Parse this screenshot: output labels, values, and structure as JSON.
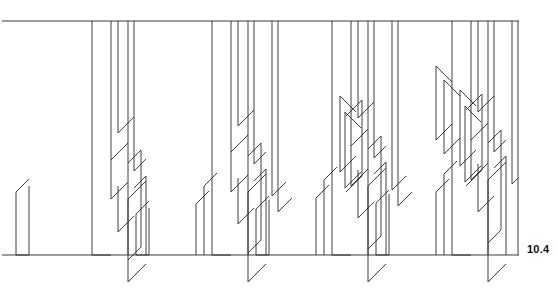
{
  "figure": {
    "label": "10.4",
    "label_x": 527,
    "label_y": 243,
    "background_color": "#ffffff",
    "line_color": "#2b2b2b",
    "rule_color": "#3a3a3a"
  },
  "chart_data": {
    "type": "line",
    "title": "",
    "subtitle": "",
    "xlabel": "",
    "ylabel": "",
    "annotations": [
      "10.4"
    ],
    "grid": false,
    "legend": null,
    "xlim": [
      0,
      558
    ],
    "ylim": [
      295,
      0
    ],
    "axis_rules": [
      {
        "name": "top-rule",
        "x1": 2,
        "y1": 21,
        "x2": 519,
        "y2": 21
      },
      {
        "name": "baseline-rule",
        "x1": 2,
        "y1": 255,
        "x2": 519,
        "y2": 255
      }
    ],
    "panels": [
      {
        "name": "panel-1",
        "origin_x": 0,
        "density": 1
      },
      {
        "name": "panel-2",
        "origin_x": 120,
        "density": 2
      },
      {
        "name": "panel-3",
        "origin_x": 240,
        "density": 3
      },
      {
        "name": "panel-4",
        "origin_x": 360,
        "density": 4
      }
    ],
    "series": [
      {
        "name": "stems",
        "comment": "vertical segments: x, y_top, y_bottom",
        "values": [
          [
            92,
            21,
            255
          ],
          [
            111,
            21,
            160
          ],
          [
            118,
            21,
            133
          ],
          [
            128,
            21,
            255
          ],
          [
            134,
            21,
            171
          ],
          [
            16,
            192,
            255
          ],
          [
            29,
            186,
            255
          ],
          [
            111,
            160,
            199
          ],
          [
            118,
            186,
            232
          ],
          [
            128,
            199,
            282
          ],
          [
            141,
            150,
            247
          ],
          [
            146,
            176,
            255
          ],
          [
            212,
            21,
            255
          ],
          [
            231,
            21,
            152
          ],
          [
            238,
            21,
            126
          ],
          [
            248,
            21,
            255
          ],
          [
            254,
            21,
            164
          ],
          [
            136,
            214,
            255
          ],
          [
            149,
            208,
            255
          ],
          [
            231,
            152,
            192
          ],
          [
            238,
            178,
            224
          ],
          [
            248,
            192,
            282
          ],
          [
            261,
            143,
            240
          ],
          [
            266,
            169,
            255
          ],
          [
            272,
            21,
            196
          ],
          [
            278,
            21,
            212
          ],
          [
            196,
            204,
            255
          ],
          [
            204,
            186,
            255
          ],
          [
            332,
            21,
            255
          ],
          [
            351,
            21,
            146
          ],
          [
            358,
            21,
            118
          ],
          [
            368,
            21,
            255
          ],
          [
            374,
            21,
            158
          ],
          [
            256,
            209,
            255
          ],
          [
            269,
            200,
            255
          ],
          [
            351,
            146,
            186
          ],
          [
            358,
            170,
            218
          ],
          [
            368,
            186,
            282
          ],
          [
            381,
            136,
            236
          ],
          [
            386,
            162,
            255
          ],
          [
            392,
            21,
            190
          ],
          [
            398,
            21,
            206
          ],
          [
            316,
            198,
            255
          ],
          [
            324,
            180,
            255
          ],
          [
            340,
            96,
            172
          ],
          [
            345,
            112,
            188
          ],
          [
            362,
            100,
            176
          ],
          [
            452,
            21,
            255
          ],
          [
            471,
            21,
            140
          ],
          [
            478,
            21,
            112
          ],
          [
            488,
            21,
            255
          ],
          [
            494,
            21,
            152
          ],
          [
            376,
            203,
            255
          ],
          [
            389,
            194,
            255
          ],
          [
            471,
            140,
            180
          ],
          [
            478,
            164,
            212
          ],
          [
            488,
            180,
            282
          ],
          [
            501,
            130,
            230
          ],
          [
            506,
            156,
            255
          ],
          [
            512,
            21,
            184
          ],
          [
            518,
            21,
            255
          ],
          [
            436,
            192,
            255
          ],
          [
            444,
            174,
            255
          ],
          [
            460,
            90,
            166
          ],
          [
            465,
            106,
            182
          ],
          [
            482,
            94,
            170
          ],
          [
            436,
            66,
            140
          ],
          [
            444,
            80,
            154
          ]
        ]
      },
      {
        "name": "connectors",
        "comment": "45-degree diagonal segments: x1,y1,x2,y2",
        "values": [
          [
            16,
            192,
            29,
            179
          ],
          [
            29,
            255,
            16,
            255
          ],
          [
            92,
            255,
            111,
            255
          ],
          [
            111,
            160,
            128,
            143
          ],
          [
            111,
            199,
            128,
            182
          ],
          [
            118,
            133,
            134,
            117
          ],
          [
            118,
            232,
            134,
            216
          ],
          [
            128,
            282,
            146,
            264
          ],
          [
            128,
            199,
            146,
            181
          ],
          [
            134,
            171,
            146,
            159
          ],
          [
            141,
            150,
            128,
            163
          ],
          [
            141,
            247,
            128,
            260
          ],
          [
            146,
            176,
            134,
            188
          ],
          [
            136,
            214,
            149,
            201
          ],
          [
            149,
            255,
            136,
            255
          ],
          [
            212,
            255,
            231,
            255
          ],
          [
            231,
            152,
            248,
            135
          ],
          [
            231,
            192,
            248,
            175
          ],
          [
            238,
            126,
            254,
            110
          ],
          [
            238,
            224,
            254,
            208
          ],
          [
            248,
            282,
            266,
            264
          ],
          [
            248,
            192,
            266,
            174
          ],
          [
            254,
            164,
            266,
            152
          ],
          [
            261,
            143,
            248,
            156
          ],
          [
            261,
            240,
            248,
            253
          ],
          [
            266,
            169,
            254,
            181
          ],
          [
            272,
            196,
            286,
            182
          ],
          [
            278,
            212,
            292,
            198
          ],
          [
            196,
            204,
            209,
            191
          ],
          [
            204,
            186,
            217,
            173
          ],
          [
            256,
            209,
            269,
            196
          ],
          [
            269,
            255,
            256,
            255
          ],
          [
            332,
            255,
            351,
            255
          ],
          [
            351,
            146,
            368,
            129
          ],
          [
            351,
            186,
            368,
            169
          ],
          [
            358,
            118,
            374,
            102
          ],
          [
            358,
            218,
            374,
            202
          ],
          [
            368,
            282,
            386,
            264
          ],
          [
            368,
            186,
            386,
            168
          ],
          [
            374,
            158,
            386,
            146
          ],
          [
            381,
            136,
            368,
            149
          ],
          [
            381,
            236,
            368,
            249
          ],
          [
            386,
            162,
            374,
            174
          ],
          [
            392,
            190,
            406,
            176
          ],
          [
            398,
            206,
            412,
            192
          ],
          [
            316,
            198,
            329,
            185
          ],
          [
            324,
            180,
            337,
            167
          ],
          [
            340,
            96,
            356,
            112
          ],
          [
            345,
            112,
            361,
            128
          ],
          [
            362,
            100,
            346,
            116
          ],
          [
            340,
            172,
            356,
            156
          ],
          [
            345,
            188,
            361,
            172
          ],
          [
            362,
            176,
            346,
            192
          ],
          [
            376,
            203,
            389,
            190
          ],
          [
            389,
            255,
            376,
            255
          ],
          [
            452,
            255,
            471,
            255
          ],
          [
            471,
            140,
            488,
            123
          ],
          [
            471,
            180,
            488,
            163
          ],
          [
            478,
            112,
            494,
            96
          ],
          [
            478,
            212,
            494,
            196
          ],
          [
            488,
            282,
            506,
            264
          ],
          [
            488,
            180,
            506,
            162
          ],
          [
            494,
            152,
            506,
            140
          ],
          [
            501,
            130,
            488,
            143
          ],
          [
            501,
            230,
            488,
            243
          ],
          [
            506,
            156,
            494,
            168
          ],
          [
            512,
            184,
            518,
            178
          ],
          [
            436,
            192,
            449,
            179
          ],
          [
            444,
            174,
            457,
            161
          ],
          [
            460,
            90,
            476,
            106
          ],
          [
            465,
            106,
            481,
            122
          ],
          [
            482,
            94,
            466,
            110
          ],
          [
            460,
            166,
            476,
            150
          ],
          [
            465,
            182,
            481,
            166
          ],
          [
            482,
            170,
            466,
            186
          ],
          [
            436,
            66,
            452,
            82
          ],
          [
            444,
            80,
            460,
            96
          ],
          [
            436,
            140,
            452,
            124
          ],
          [
            444,
            154,
            460,
            138
          ]
        ]
      }
    ]
  }
}
